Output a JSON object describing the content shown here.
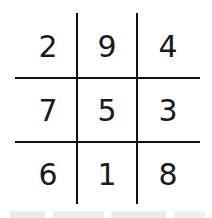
{
  "diagram": {
    "type": "magic-square-grid",
    "rows": [
      [
        "2",
        "9",
        "4"
      ],
      [
        "7",
        "5",
        "3"
      ],
      [
        "6",
        "1",
        "8"
      ]
    ]
  }
}
